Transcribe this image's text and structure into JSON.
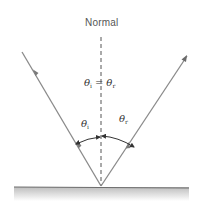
{
  "diagram": {
    "normal_label": "Normal",
    "equation": {
      "left_symbol": "θ",
      "left_sub": "i",
      "operator": "=",
      "right_symbol": "θ",
      "right_sub": "r"
    },
    "angle_incident": {
      "symbol": "θ",
      "sub": "i"
    },
    "angle_reflected": {
      "symbol": "θ",
      "sub": "r"
    },
    "colors": {
      "ray": "#8a8a8a",
      "normal": "#555555",
      "surface": "#6e6e6e",
      "text": "#333333"
    },
    "elements": [
      "incident-ray",
      "reflected-ray",
      "normal-line",
      "reflecting-surface",
      "angle-arc-incident",
      "angle-arc-reflected"
    ]
  }
}
